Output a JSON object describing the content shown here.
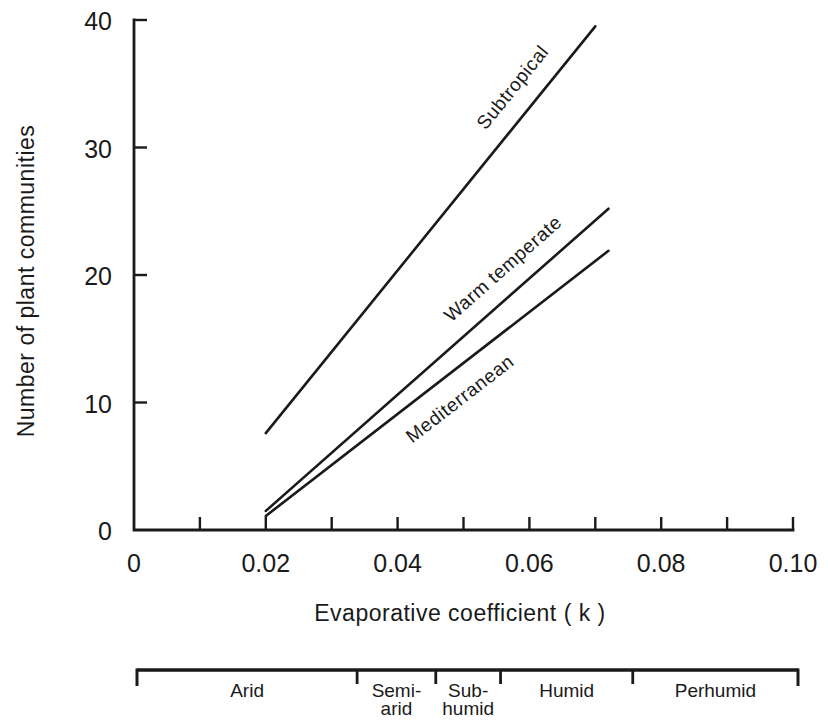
{
  "chart_data": {
    "type": "line",
    "title": "",
    "xlabel": "Evaporative coefficient ( k )",
    "ylabel": "Number of plant communities",
    "xlim": [
      0,
      0.1
    ],
    "ylim": [
      0,
      40
    ],
    "grid": false,
    "legend_position": "labels-on-lines",
    "ink_color": "#1a1a1a",
    "background_color": "#ffffff",
    "x_tick_marks": [
      0.01,
      0.02,
      0.03,
      0.04,
      0.05,
      0.06,
      0.07,
      0.08,
      0.09,
      0.1
    ],
    "x_tick_labels": [
      {
        "value": 0,
        "label": "0"
      },
      {
        "value": 0.02,
        "label": "0.02"
      },
      {
        "value": 0.04,
        "label": "0.04"
      },
      {
        "value": 0.06,
        "label": "0.06"
      },
      {
        "value": 0.08,
        "label": "0.08"
      },
      {
        "value": 0.1,
        "label": "0.10"
      }
    ],
    "y_tick_marks": [
      10,
      20,
      30,
      40
    ],
    "y_tick_labels": [
      {
        "value": 0,
        "label": "0"
      },
      {
        "value": 10,
        "label": "10"
      },
      {
        "value": 20,
        "label": "20"
      },
      {
        "value": 30,
        "label": "30"
      },
      {
        "value": 40,
        "label": "40"
      }
    ],
    "series": [
      {
        "name": "Subtropical",
        "points": [
          [
            0.02,
            7.6
          ],
          [
            0.07,
            39.5
          ]
        ],
        "label_t": 0.81,
        "label_offset": 26
      },
      {
        "name": "Warm temperate",
        "points": [
          [
            0.02,
            1.5
          ],
          [
            0.072,
            25.2
          ]
        ],
        "label_t": 0.74,
        "label_offset": 25
      },
      {
        "name": "Mediterranean",
        "points": [
          [
            0.02,
            1.1
          ],
          [
            0.072,
            21.9
          ]
        ],
        "label_t": 0.52,
        "label_offset": -26
      }
    ],
    "climate_zone_scale": {
      "segments": [
        {
          "label_lines": [
            "Arid"
          ],
          "from": 0,
          "to": 0.0333
        },
        {
          "label_lines": [
            "Semi-",
            "arid"
          ],
          "from": 0.0333,
          "to": 0.0452
        },
        {
          "label_lines": [
            "Sub-",
            "humid"
          ],
          "from": 0.0452,
          "to": 0.055
        },
        {
          "label_lines": [
            "Humid"
          ],
          "from": 0.055,
          "to": 0.075
        },
        {
          "label_lines": [
            "Perhumid"
          ],
          "from": 0.075,
          "to": 0.1
        }
      ]
    }
  }
}
